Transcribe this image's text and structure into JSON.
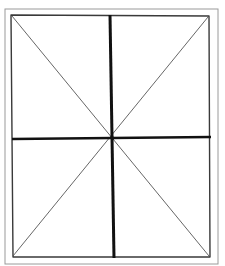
{
  "diagram": {
    "colors": {
      "background": "#ffffff",
      "frame": "#9a9a9a",
      "inner_border": "#3a3a3a",
      "cross": "#111111",
      "diagonal": "#555555"
    },
    "outer_frame": {
      "x1": 5,
      "y1": 9,
      "x2": 218,
      "y2": 264
    },
    "inner_rect": {
      "top_left": [
        11,
        15
      ],
      "top_right": [
        209,
        16
      ],
      "bottom_right": [
        210,
        257
      ],
      "bottom_left": [
        13,
        257
      ]
    },
    "center": [
      113,
      138
    ],
    "cross": {
      "vertical": {
        "from": [
          110,
          15
        ],
        "to": [
          114,
          258
        ]
      },
      "horizontal": {
        "from": [
          12,
          139
        ],
        "to": [
          211,
          137
        ]
      }
    },
    "diagonals": [
      {
        "from": [
          12,
          16
        ],
        "to": [
          209,
          256
        ]
      },
      {
        "from": [
          208,
          17
        ],
        "to": [
          13,
          256
        ]
      }
    ]
  }
}
